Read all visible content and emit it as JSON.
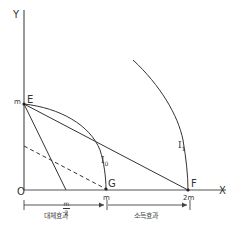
{
  "diagram": {
    "axes": {
      "y_label": "Y",
      "x_label": "X",
      "origin_label": "O"
    },
    "y_ticks": [
      {
        "label": "m"
      }
    ],
    "x_ticks": [
      {
        "numerator": "m",
        "denominator": "2"
      },
      {
        "label": "m"
      },
      {
        "label": "2m"
      }
    ],
    "points": {
      "E": "E",
      "G": "G",
      "F": "F"
    },
    "curves": {
      "I0": {
        "label": "I",
        "subscript": "0"
      },
      "I1": {
        "label": "I",
        "subscript": "1"
      }
    },
    "effects": {
      "substitution": "대체효과",
      "income": "소득효과"
    },
    "colors": {
      "line": "#333333",
      "background": "#ffffff"
    }
  }
}
